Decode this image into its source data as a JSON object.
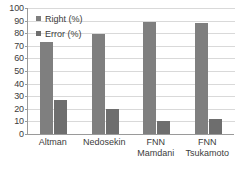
{
  "chart_data": {
    "type": "bar",
    "title": "",
    "xlabel": "",
    "ylabel": "",
    "ylim": [
      0,
      100
    ],
    "ytick_step": 10,
    "yticks": [
      "100",
      "90",
      "80",
      "70",
      "60",
      "50",
      "40",
      "30",
      "20",
      "10",
      "0"
    ],
    "grid": true,
    "legend_position": "top-left",
    "categories": [
      "Altman",
      "Nedosekin",
      "FNN\nMamdani",
      "FNN\nTsukamoto"
    ],
    "series": [
      {
        "name": "Right (%)",
        "values": [
          73,
          79,
          89,
          88
        ],
        "color": "#7f7f7f"
      },
      {
        "name": "Error (%)",
        "values": [
          27,
          20,
          10,
          12
        ],
        "color": "#6e6e6e"
      }
    ]
  },
  "colors": {
    "axis": "#9a9a9a",
    "grid": "#d9d9d9",
    "text": "#3c3c3c",
    "background": "#ffffff",
    "right_series": "#7f7f7f",
    "error_series": "#6e6e6e"
  }
}
